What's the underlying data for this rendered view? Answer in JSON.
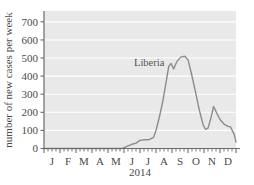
{
  "chart_data": {
    "type": "line",
    "title": "",
    "subtitle": "",
    "xlabel": "2014",
    "ylabel": "number of new cases per week",
    "ylim": [
      0,
      760
    ],
    "yticks": [
      0,
      100,
      200,
      300,
      400,
      500,
      600,
      700
    ],
    "ytick_labels": [
      "0",
      "100",
      "200",
      "300",
      "400",
      "500",
      "600",
      "700"
    ],
    "xtick_labels": [
      "J",
      "F",
      "M",
      "A",
      "M",
      "J",
      "J",
      "A",
      "S",
      "O",
      "N",
      "D"
    ],
    "x_minor_ticks_per_month": 4,
    "grid": "horizontal-white",
    "legend_position": "inline-annotation",
    "annotations": [
      {
        "text": "Liberia",
        "x_month": 6.1,
        "y_value": 490
      }
    ],
    "series": [
      {
        "name": "Liberia",
        "color": "#8c8c8c",
        "line_width": 1.4,
        "x_units": "month index (1 = Jan 1, 13 = Dec 31, 2014)",
        "points": [
          {
            "x": 1.0,
            "y": 0
          },
          {
            "x": 2.0,
            "y": 0
          },
          {
            "x": 3.0,
            "y": 0
          },
          {
            "x": 4.0,
            "y": 0
          },
          {
            "x": 5.0,
            "y": 0
          },
          {
            "x": 5.5,
            "y": 0
          },
          {
            "x": 5.9,
            "y": 0
          },
          {
            "x": 6.15,
            "y": 10
          },
          {
            "x": 6.45,
            "y": 22
          },
          {
            "x": 6.75,
            "y": 30
          },
          {
            "x": 7.0,
            "y": 45
          },
          {
            "x": 7.3,
            "y": 48
          },
          {
            "x": 7.6,
            "y": 50
          },
          {
            "x": 7.85,
            "y": 62
          },
          {
            "x": 8.0,
            "y": 100
          },
          {
            "x": 8.2,
            "y": 170
          },
          {
            "x": 8.4,
            "y": 250
          },
          {
            "x": 8.6,
            "y": 350
          },
          {
            "x": 8.8,
            "y": 455
          },
          {
            "x": 8.95,
            "y": 470
          },
          {
            "x": 9.1,
            "y": 440
          },
          {
            "x": 9.3,
            "y": 480
          },
          {
            "x": 9.55,
            "y": 505
          },
          {
            "x": 9.8,
            "y": 510
          },
          {
            "x": 10.0,
            "y": 490
          },
          {
            "x": 10.2,
            "y": 420
          },
          {
            "x": 10.45,
            "y": 320
          },
          {
            "x": 10.7,
            "y": 215
          },
          {
            "x": 10.95,
            "y": 130
          },
          {
            "x": 11.1,
            "y": 105
          },
          {
            "x": 11.25,
            "y": 112
          },
          {
            "x": 11.45,
            "y": 175
          },
          {
            "x": 11.6,
            "y": 232
          },
          {
            "x": 11.8,
            "y": 195
          },
          {
            "x": 12.0,
            "y": 160
          },
          {
            "x": 12.25,
            "y": 135
          },
          {
            "x": 12.5,
            "y": 122
          },
          {
            "x": 12.65,
            "y": 120
          },
          {
            "x": 12.9,
            "y": 75
          },
          {
            "x": 13.0,
            "y": 35
          }
        ]
      }
    ]
  },
  "axes": {
    "y_axis_title": "number of new cases per week",
    "x_axis_title": "2014"
  },
  "annotation": {
    "liberia_label": "Liberia"
  }
}
